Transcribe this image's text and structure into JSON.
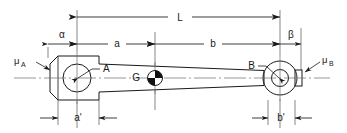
{
  "diagram": {
    "colors": {
      "line": "#1a1a1a",
      "centerline": "#6b6b6b",
      "extension": "#555555",
      "background": "#ffffff",
      "cg_fill": "#111111"
    },
    "dimensions": [
      {
        "id": "L",
        "label": "L",
        "row": "top",
        "from_x": 77,
        "to_x": 280
      },
      {
        "id": "alpha",
        "label": "α",
        "row": "middle",
        "from_x": 48,
        "to_x": 77
      },
      {
        "id": "a",
        "label": "a",
        "row": "middle",
        "from_x": 77,
        "to_x": 155
      },
      {
        "id": "b",
        "label": "b",
        "row": "middle",
        "from_x": 155,
        "to_x": 280
      },
      {
        "id": "beta",
        "label": "β",
        "row": "middle",
        "from_x": 280,
        "to_x": 301
      },
      {
        "id": "a_prime",
        "label": "a'",
        "row": "bottom",
        "from_x": 58,
        "to_x": 99
      },
      {
        "id": "b_prime",
        "label": "b'",
        "row": "bottom",
        "from_x": 268,
        "to_x": 295
      }
    ],
    "point_labels": [
      {
        "id": "A",
        "label": "A"
      },
      {
        "id": "B",
        "label": "B"
      },
      {
        "id": "G",
        "label": "G"
      }
    ],
    "mass_labels": [
      {
        "id": "mu_A",
        "symbol": "μ",
        "subscript": "A",
        "side": "left"
      },
      {
        "id": "mu_B",
        "symbol": "μ",
        "subscript": "B",
        "side": "right"
      }
    ],
    "labels": {
      "L": "L",
      "alpha": "α",
      "beta": "β",
      "a": "a",
      "b": "b",
      "a_prime": "a'",
      "b_prime": "b'",
      "A": "A",
      "B": "B",
      "G": "G",
      "mu": "μ",
      "sub_A": "A",
      "sub_B": "B"
    }
  }
}
